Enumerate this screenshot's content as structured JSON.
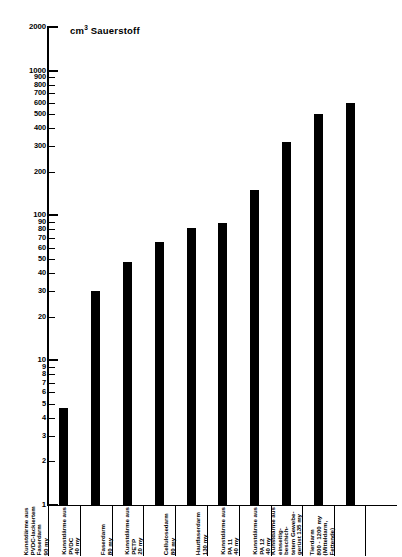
{
  "chart": {
    "axis_title": "cm",
    "axis_title_sup": "3",
    "axis_title_rest": " Sauerstoff"
  },
  "chart_data": {
    "type": "bar",
    "xlabel": "",
    "ylabel": "cm³ Sauerstoff",
    "yscale": "log",
    "ylim": [
      1,
      2000
    ],
    "grid": false,
    "legend": null,
    "ytick_labels": [
      "2000",
      "1000",
      "900",
      "800",
      "700",
      "600",
      "500",
      "400",
      "300",
      "200",
      "100",
      "90",
      "80",
      "70",
      "60",
      "50",
      "40",
      "30",
      "20",
      "10",
      "9",
      "8",
      "7",
      "6",
      "5",
      "4",
      "3",
      "2",
      "1"
    ],
    "categories": [
      "Kunstdärme aus\nPVDC-lackiertem\nFaserdarm\n90 my",
      "Kunstdärme aus\nPVDC\n40 my",
      "Faserdarm\n80 my",
      "Kunstdärme aus\nPETP\n20 my",
      "Cellulosedarm\n80 my",
      "Hautfaserdarm\n130 my",
      "Kunstdärme aus\nPA 11\n40 my",
      "Kunstdärme aus\nPA 12\n40 my",
      "Kunstdärme aus\neinseitig-beschich-\ntetem Gewebe-\ngerüst 135 my",
      "Tierdarm\n800 - 1200 my\n(Mitteldarm,\nFettende)"
    ],
    "values": [
      4.7,
      30,
      48,
      65,
      82,
      88,
      150,
      320,
      500,
      600
    ]
  },
  "colors": {
    "bar": "#000000",
    "axis": "#000000",
    "background": "#ffffff"
  }
}
